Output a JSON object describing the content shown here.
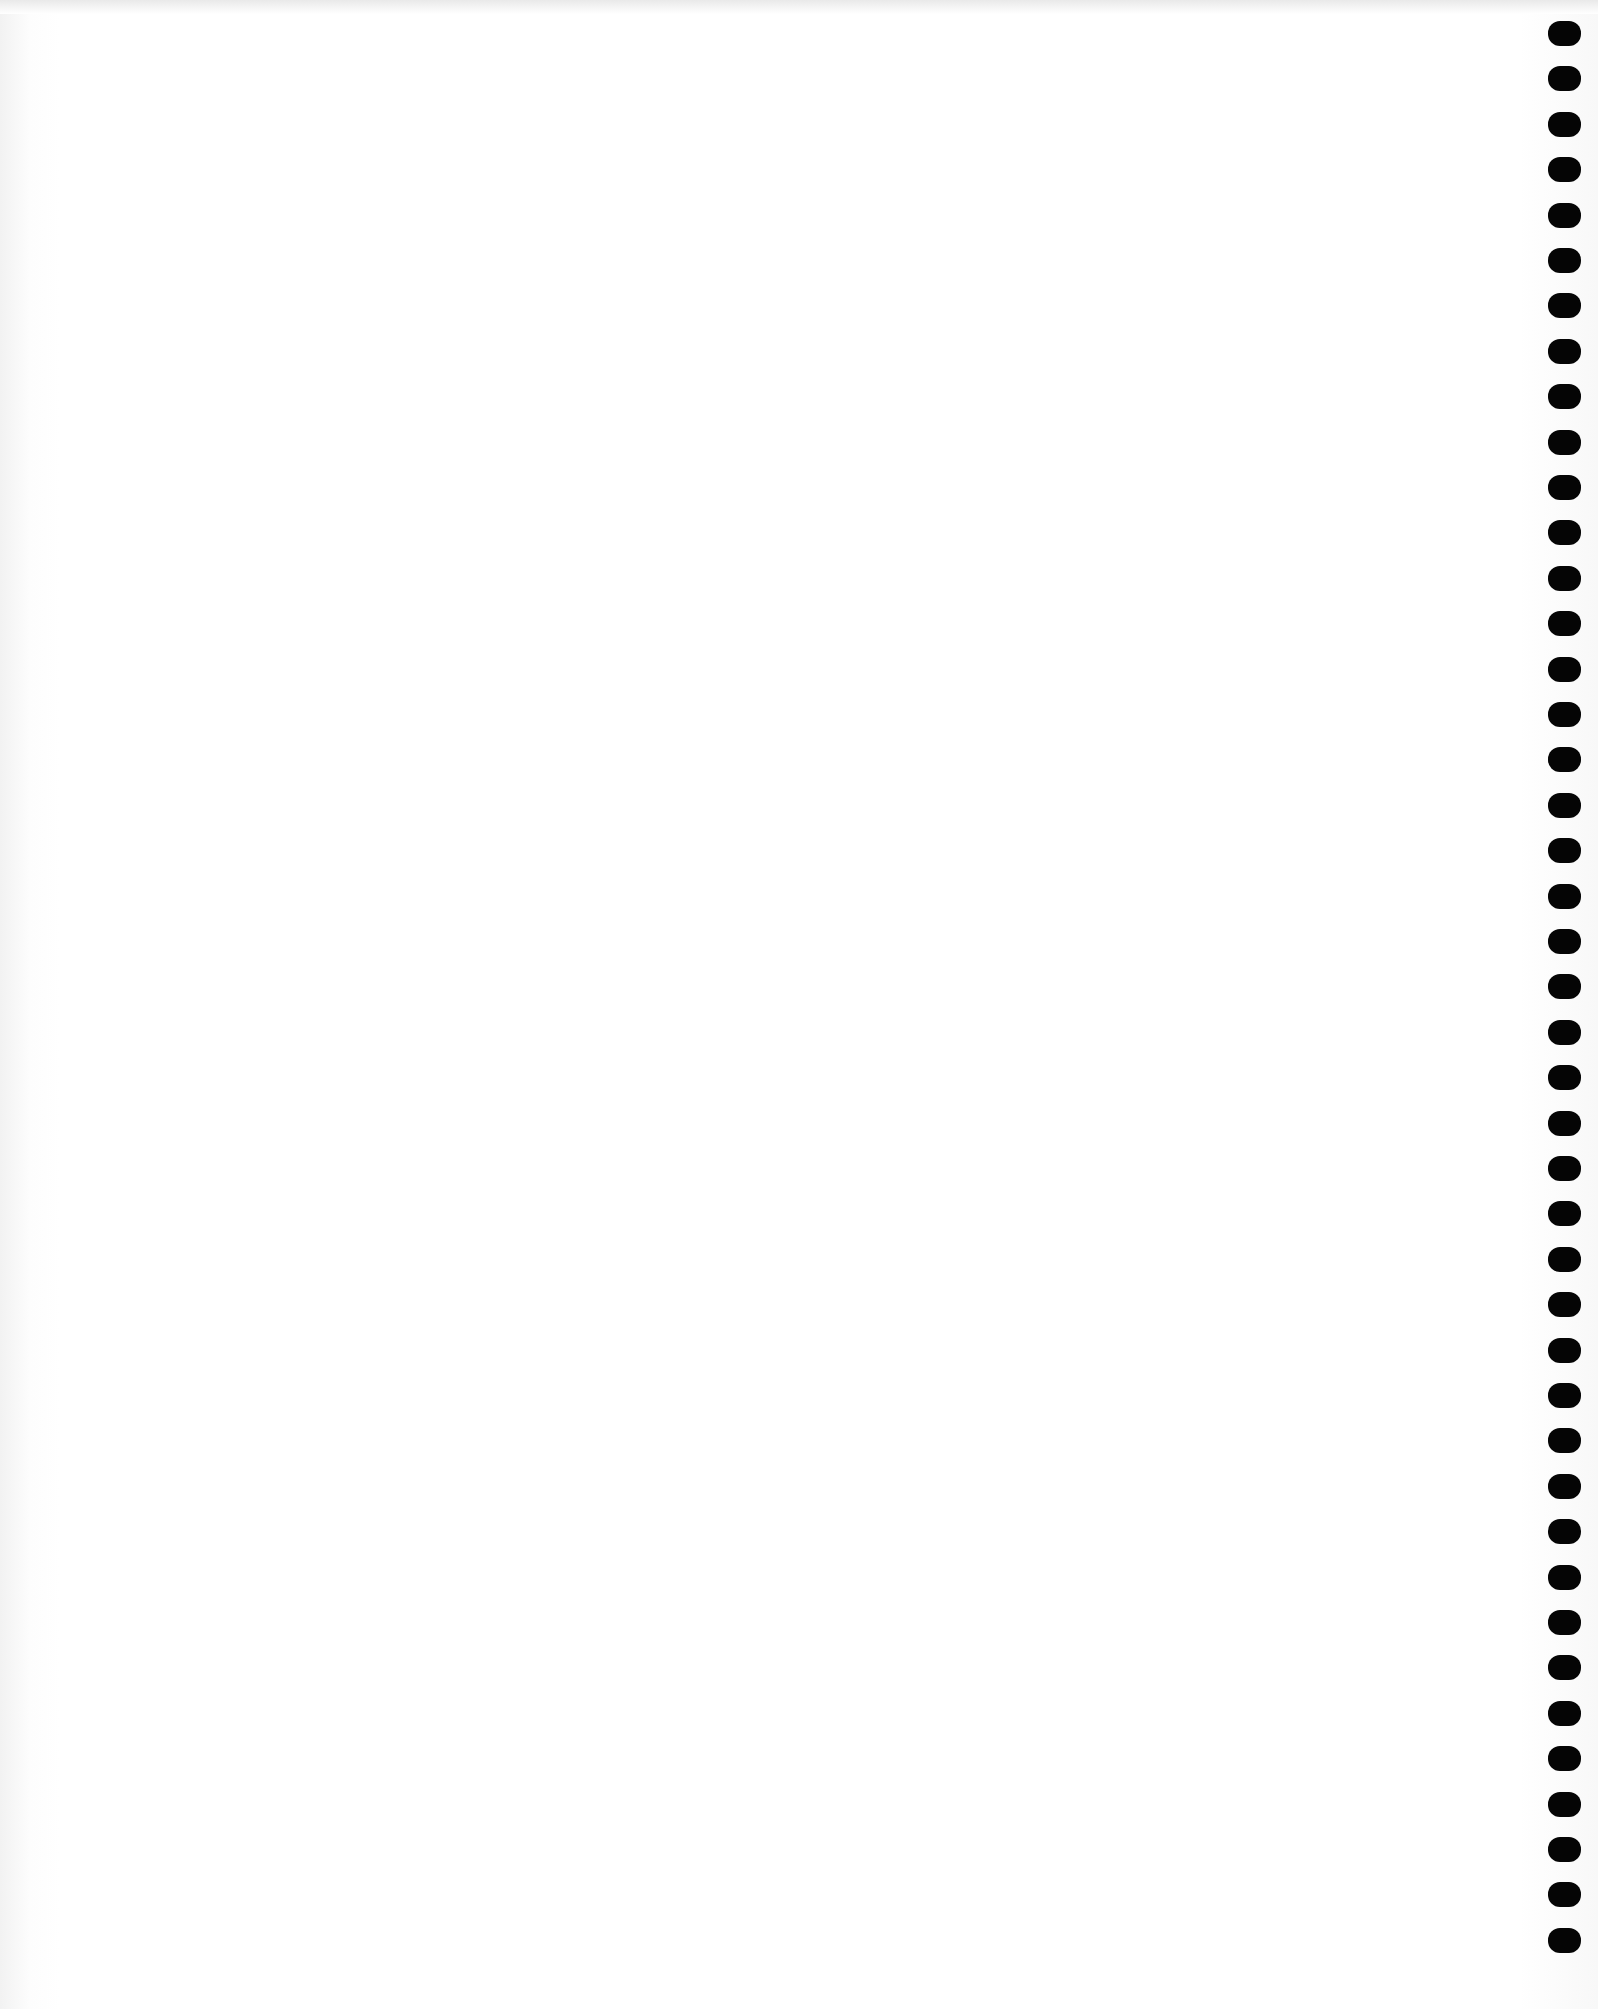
{
  "page": {
    "type": "blank-notebook-page",
    "background_color": "#ffffff",
    "content_text": ""
  },
  "binding": {
    "side": "right",
    "hole_count": 43,
    "hole_color": "#050505",
    "first_hole_top": 21,
    "hole_spacing": 45.4
  }
}
